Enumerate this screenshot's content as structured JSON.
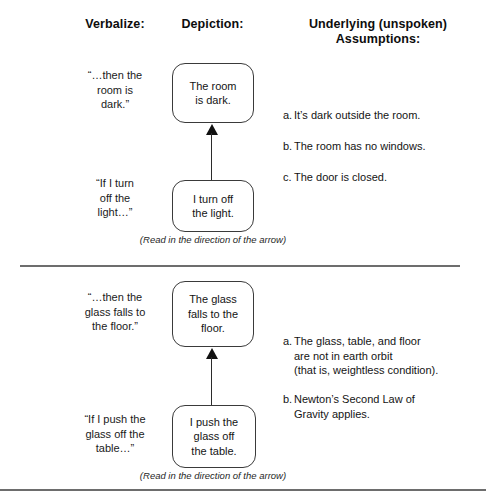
{
  "headers": {
    "verbalize": "Verbalize:",
    "depiction": "Depiction:",
    "assumptions": "Underlying (unspoken)\nAssumptions:"
  },
  "panels": [
    {
      "id": "panel-light",
      "verbalize_top": "“…then the\nroom is\ndark.”",
      "verbalize_bottom": "“If I turn\noff the\nlight…”",
      "depiction_top": "The room\nis dark.",
      "depiction_bottom": "I turn off\nthe light.",
      "assumptions": [
        {
          "marker": "a.",
          "text": "It’s dark outside the room."
        },
        {
          "marker": "b.",
          "text": "The room has no windows."
        },
        {
          "marker": "c.",
          "text": "The door is closed."
        }
      ],
      "caption": "(Read in the direction of the arrow)"
    },
    {
      "id": "panel-glass",
      "verbalize_top": "“…then the\nglass falls to\nthe floor.”",
      "verbalize_bottom": "“If I push the\nglass off the\ntable…”",
      "depiction_top": "The glass\nfalls to the\nfloor.",
      "depiction_bottom": "I push the\nglass off\nthe table.",
      "assumptions": [
        {
          "marker": "a.",
          "text": "The glass, table, and floor\nare not in earth orbit\n(that is, weightless condition)."
        },
        {
          "marker": "b.",
          "text": "Newton’s Second Law of\nGravity applies."
        }
      ],
      "caption": "(Read in the direction of the arrow)"
    }
  ],
  "colors": {
    "box_border": "#3a3a3a",
    "arrow": "#111111",
    "divider": "#6d6d6d",
    "text": "#141414"
  }
}
